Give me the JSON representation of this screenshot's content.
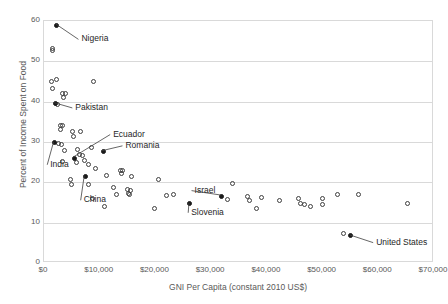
{
  "chart_data": {
    "type": "scatter",
    "title": "",
    "xlabel": "GNI Per Capita (constant 2010 US$)",
    "ylabel": "Percent of Income Spent on Food",
    "xlim": [
      0,
      70000
    ],
    "ylim": [
      0,
      60
    ],
    "xticks": [
      0,
      10000,
      20000,
      30000,
      40000,
      50000,
      60000,
      70000
    ],
    "xticklabels": [
      "$0",
      "$10,000",
      "$20,000",
      "$30,000",
      "$40,000",
      "$50,000",
      "$60,000",
      "$70,000"
    ],
    "yticks": [
      0,
      10,
      20,
      30,
      40,
      50,
      60
    ],
    "yticklabels": [
      "0",
      "10",
      "20",
      "30",
      "40",
      "50",
      "60"
    ],
    "grid": "horizontal",
    "legend": "none",
    "marker_styles": {
      "unlabeled": "open-circle",
      "labeled": "filled-circle"
    },
    "labeled_points": [
      {
        "name": "Nigeria",
        "x": 2300,
        "y": 59.0,
        "label_x": 6900,
        "label_y": 55.2
      },
      {
        "name": "Pakistan",
        "x": 2000,
        "y": 39.5,
        "label_x": 5800,
        "label_y": 38.2
      },
      {
        "name": "Ecuador",
        "x": 5400,
        "y": 26.0,
        "label_x": 12600,
        "label_y": 31.6
      },
      {
        "name": "Romania",
        "x": 10600,
        "y": 27.6,
        "label_x": 14800,
        "label_y": 28.8
      },
      {
        "name": "India",
        "x": 1900,
        "y": 29.8,
        "label_x": 1300,
        "label_y": 24.1
      },
      {
        "name": "China",
        "x": 7400,
        "y": 21.4,
        "label_x": 7300,
        "label_y": 15.3
      },
      {
        "name": "Slovenia",
        "x": 26200,
        "y": 14.7,
        "label_x": 26600,
        "label_y": 12.2
      },
      {
        "name": "Israel",
        "x": 31900,
        "y": 16.6,
        "label_x": 27200,
        "label_y": 17.7
      },
      {
        "name": "United States",
        "x": 55100,
        "y": 6.7,
        "label_x": 59800,
        "label_y": 4.8
      }
    ],
    "unlabeled_points": [
      {
        "x": 1500,
        "y": 53.2
      },
      {
        "x": 1500,
        "y": 52.8
      },
      {
        "x": 2200,
        "y": 45.6
      },
      {
        "x": 1400,
        "y": 45.0
      },
      {
        "x": 1500,
        "y": 43.3
      },
      {
        "x": 8900,
        "y": 45.0
      },
      {
        "x": 3400,
        "y": 42.0
      },
      {
        "x": 3900,
        "y": 42.0
      },
      {
        "x": 3500,
        "y": 41.0
      },
      {
        "x": 2500,
        "y": 39.3
      },
      {
        "x": 2900,
        "y": 34.2
      },
      {
        "x": 3300,
        "y": 34.0
      },
      {
        "x": 3000,
        "y": 33.0
      },
      {
        "x": 5200,
        "y": 32.5
      },
      {
        "x": 6600,
        "y": 32.6
      },
      {
        "x": 5300,
        "y": 31.3
      },
      {
        "x": 2600,
        "y": 29.7
      },
      {
        "x": 3100,
        "y": 29.5
      },
      {
        "x": 3600,
        "y": 27.9
      },
      {
        "x": 6000,
        "y": 28.2
      },
      {
        "x": 8500,
        "y": 28.7
      },
      {
        "x": 6400,
        "y": 27.0
      },
      {
        "x": 6900,
        "y": 26.6
      },
      {
        "x": 3400,
        "y": 25.2
      },
      {
        "x": 5900,
        "y": 25.0
      },
      {
        "x": 7300,
        "y": 25.3
      },
      {
        "x": 7900,
        "y": 24.4
      },
      {
        "x": 9300,
        "y": 23.4
      },
      {
        "x": 13700,
        "y": 23.0
      },
      {
        "x": 14100,
        "y": 22.9
      },
      {
        "x": 13900,
        "y": 22.3
      },
      {
        "x": 11200,
        "y": 21.7
      },
      {
        "x": 15700,
        "y": 21.4
      },
      {
        "x": 4700,
        "y": 20.6
      },
      {
        "x": 20600,
        "y": 20.6
      },
      {
        "x": 5000,
        "y": 19.5
      },
      {
        "x": 8000,
        "y": 19.4
      },
      {
        "x": 12400,
        "y": 18.7
      },
      {
        "x": 15000,
        "y": 18.1
      },
      {
        "x": 15500,
        "y": 18.0
      },
      {
        "x": 15100,
        "y": 17.2
      },
      {
        "x": 15400,
        "y": 17.0
      },
      {
        "x": 13100,
        "y": 16.9
      },
      {
        "x": 22000,
        "y": 16.8
      },
      {
        "x": 23300,
        "y": 17.0
      },
      {
        "x": 8700,
        "y": 15.9
      },
      {
        "x": 10900,
        "y": 13.9
      },
      {
        "x": 19800,
        "y": 13.4
      },
      {
        "x": 33800,
        "y": 19.8
      },
      {
        "x": 32900,
        "y": 15.8
      },
      {
        "x": 36600,
        "y": 16.6
      },
      {
        "x": 36900,
        "y": 15.5
      },
      {
        "x": 39000,
        "y": 16.3
      },
      {
        "x": 42300,
        "y": 15.5
      },
      {
        "x": 38200,
        "y": 13.4
      },
      {
        "x": 45700,
        "y": 15.9
      },
      {
        "x": 46100,
        "y": 14.8
      },
      {
        "x": 46800,
        "y": 14.4
      },
      {
        "x": 47800,
        "y": 14.1
      },
      {
        "x": 49900,
        "y": 16.1
      },
      {
        "x": 50000,
        "y": 14.6
      },
      {
        "x": 53800,
        "y": 7.3
      },
      {
        "x": 52700,
        "y": 16.9
      },
      {
        "x": 56500,
        "y": 17.0
      },
      {
        "x": 65300,
        "y": 14.7
      }
    ]
  },
  "axes": {
    "x_title": "GNI Per Capita (constant 2010 US$)",
    "y_title": "Percent of Income Spent on Food"
  }
}
